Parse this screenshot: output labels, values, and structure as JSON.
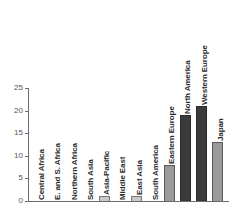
{
  "chart_data": {
    "type": "bar",
    "title": "",
    "subtitle": "",
    "xlabel": "",
    "ylabel": "",
    "ylim": [
      0,
      25
    ],
    "yticks": [
      0,
      5,
      10,
      15,
      20,
      25
    ],
    "grid": false,
    "legend": null,
    "orientation": "vertical",
    "label_rotation": 90,
    "categories": [
      "Central Africa",
      "E. and S. Africa",
      "Northern Africa",
      "South Asia",
      "Asia-Pacific",
      "Middle East",
      "East Asia",
      "South America",
      "Eastern Europe",
      "North America",
      "Western Europe",
      "Japan"
    ],
    "values": [
      0,
      0,
      0,
      0,
      1,
      0,
      1,
      0,
      8,
      19,
      21,
      13
    ],
    "bar_styles": [
      "zero",
      "zero",
      "zero",
      "zero",
      "light",
      "zero",
      "light",
      "zero",
      "mid",
      "dark",
      "dark",
      "mid"
    ],
    "colors": {
      "light": "#c9c9c9",
      "mid": "#9a9a9a",
      "dark": "#3b3b3b",
      "axis": "#6b6b6b",
      "tick_label": "#555555",
      "bar_label": "#2b2b2b",
      "background": "#ffffff"
    }
  }
}
